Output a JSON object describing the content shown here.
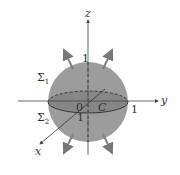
{
  "diagram": {
    "type": "sphere-with-outward-normals",
    "axes": {
      "x": "x",
      "y": "y",
      "z": "z"
    },
    "origin_label": "0",
    "curve_label": "C",
    "surface_labels": {
      "upper": "Σ",
      "upper_sub": "1",
      "lower": "Σ",
      "lower_sub": "2"
    },
    "ticks": {
      "z": "1",
      "y": "1",
      "x": "1"
    },
    "colors": {
      "sphere": "#9a9a9a",
      "equator_band": "#808080",
      "arrow": "#7f7f7f",
      "axis": "#555555"
    }
  }
}
